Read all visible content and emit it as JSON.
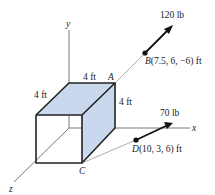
{
  "diagram": {
    "axes": {
      "x_label": "x",
      "y_label": "y",
      "z_label": "z"
    },
    "box": {
      "dimensions": [
        {
          "label": "4 ft",
          "edge": "top-back"
        },
        {
          "label": "4 ft",
          "edge": "top-left-depth"
        },
        {
          "label": "4 ft",
          "edge": "right-height"
        }
      ],
      "face_color": "#c9d8ec",
      "edge_color": "#222222"
    },
    "points": [
      {
        "name": "A"
      },
      {
        "name": "C"
      }
    ],
    "forces": [
      {
        "magnitude": "120 lb",
        "point_name": "B",
        "point_coords": "(7.5, 6, −6) ft"
      },
      {
        "magnitude": "70 lb",
        "point_name": "D",
        "point_coords": "(10, 3, 6) ft"
      }
    ]
  }
}
